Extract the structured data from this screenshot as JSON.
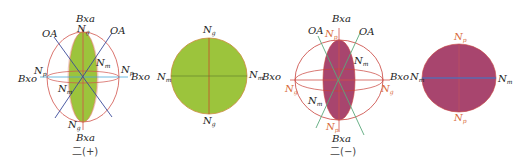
{
  "figures": [
    {
      "id": "biaxial-positive-indicatrix",
      "caption": "二(+)",
      "fill_color": "#9cc43c",
      "labels": {
        "top_axis": "Bxa",
        "bottom_axis": "Bxa",
        "left_axis": "Bxo",
        "right_axis": "Bxo",
        "optic_axis_left": "OA",
        "optic_axis_right": "OA",
        "ng_top": "N",
        "ng_top_sub": "g",
        "ng_bottom": "N",
        "ng_bottom_sub": "g",
        "np_left": "N",
        "np_left_sub": "p",
        "np_right": "N",
        "np_right_sub": "p",
        "nm_upper": "N",
        "nm_upper_sub": "m",
        "nm_lower": "N",
        "nm_lower_sub": "m"
      }
    },
    {
      "id": "biaxial-positive-section",
      "fill_color": "#9cc43c",
      "labels": {
        "top": "N",
        "top_sub": "g",
        "bottom": "N",
        "bottom_sub": "g",
        "left": "N",
        "left_sub": "m",
        "right": "N",
        "right_sub": "m"
      }
    },
    {
      "id": "biaxial-negative-indicatrix",
      "caption": "二(−)",
      "fill_color": "#a8456e",
      "labels": {
        "top_axis": "Bxa",
        "bottom_axis": "Bxa",
        "left_axis": "Bxo",
        "right_axis": "Bxo",
        "optic_axis_left": "OA",
        "optic_axis_right": "OA",
        "np_top": "N",
        "np_top_sub": "p",
        "np_bottom": "N",
        "np_bottom_sub": "p",
        "ng_left": "N",
        "ng_left_sub": "g",
        "ng_right": "N",
        "ng_right_sub": "g",
        "nm_upper": "N",
        "nm_upper_sub": "m",
        "nm_lower": "N",
        "nm_lower_sub": "m"
      }
    },
    {
      "id": "biaxial-negative-section",
      "fill_color": "#a8456e",
      "labels": {
        "top": "N",
        "top_sub": "p",
        "bottom": "N",
        "bottom_sub": "p",
        "left": "N",
        "left_sub": "m",
        "right": "N",
        "right_sub": "m"
      }
    }
  ],
  "colors": {
    "ellipse_outline": "#d0524a",
    "optic_axis_pos": "#3a4a9a",
    "optic_axis_neg": "#4a9a6a",
    "horizontal_axis_pos": "#4aa8d8",
    "green_fill": "#9cc43c",
    "magenta_fill": "#a8456e",
    "section_axis_blue": "#5a6ab0"
  }
}
